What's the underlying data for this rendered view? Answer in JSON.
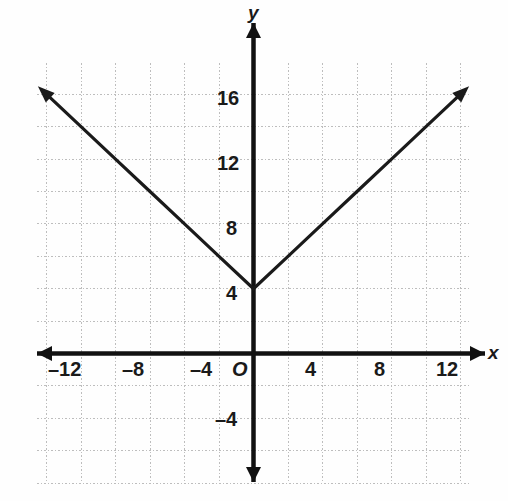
{
  "figure": {
    "kind": "coordinate-plane-graph",
    "background_color": "#fefefe",
    "curve_color": "#1a1a1a",
    "axis_color": "#111111",
    "grid_color": "#bdbdbd",
    "label_color": "#1a1a1a"
  },
  "axes": {
    "x_label": "x",
    "y_label": "y",
    "origin_label": "O"
  },
  "ticks": {
    "x": [
      {
        "label": "–12",
        "value": -12
      },
      {
        "label": "–8",
        "value": -8
      },
      {
        "label": "–4",
        "value": -4
      },
      {
        "label": "4",
        "value": 4
      },
      {
        "label": "8",
        "value": 8
      },
      {
        "label": "12",
        "value": 12
      }
    ],
    "y": [
      {
        "label": "16",
        "value": 16
      },
      {
        "label": "12",
        "value": 12
      },
      {
        "label": "8",
        "value": 8
      },
      {
        "label": "4",
        "value": 4
      },
      {
        "label": "–4",
        "value": -4
      }
    ]
  },
  "chart_data": {
    "type": "line",
    "title": "",
    "xlabel": "x",
    "ylabel": "y",
    "grid": true,
    "legend": "none",
    "xlim": [
      -13.5,
      13.5
    ],
    "ylim": [
      -7.5,
      20.5
    ],
    "x_tick_step": 4,
    "y_tick_step": 4,
    "x_grid_step": 2,
    "y_grid_step": 2,
    "series": [
      {
        "name": "y = |x| + 4",
        "equation": "y = |x| + 4",
        "vertex": [
          0,
          4
        ],
        "arrows_both_ends": true,
        "x": [
          -12.5,
          -10,
          -8,
          -6,
          -4,
          -2,
          0,
          2,
          4,
          6,
          8,
          10,
          12.5
        ],
        "values": [
          16.5,
          14,
          12,
          10,
          8,
          6,
          4,
          6,
          8,
          10,
          12,
          14,
          16.5
        ]
      }
    ],
    "annotations": []
  }
}
